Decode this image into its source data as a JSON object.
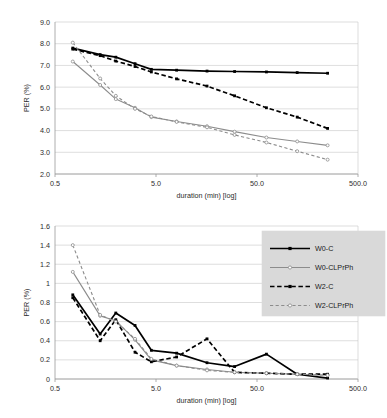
{
  "figure": {
    "title": "",
    "panels": [
      "top-chart",
      "bottom-chart"
    ]
  },
  "colors": {
    "black": "#000000",
    "gray": "#8c8c8c",
    "grid": "#c8c8c8",
    "axis": "#9a9a9a",
    "legend_bg": "#d9d9d9",
    "text": "#2b2b2b"
  },
  "legend": {
    "position": "upper-right-of-bottom-chart",
    "entries": [
      {
        "label": "W0-C",
        "color": "#000000",
        "style": "solid",
        "marker": "square"
      },
      {
        "label": "W0-CLPrPh",
        "color": "#8c8c8c",
        "style": "solid",
        "marker": "circle"
      },
      {
        "label": "W2-C",
        "color": "#000000",
        "style": "dashed",
        "marker": "square"
      },
      {
        "label": "W2-CLPrPh",
        "color": "#8c8c8c",
        "style": "dashed",
        "marker": "circle"
      }
    ]
  },
  "chart_data": [
    {
      "id": "top-chart",
      "type": "line",
      "title": "",
      "xlabel": "duration (min) [log]",
      "ylabel": "PER (%)",
      "xscale": "log",
      "xlim": [
        0.5,
        500.0
      ],
      "ylim": [
        2.0,
        9.0
      ],
      "xticks": [
        0.5,
        5.0,
        50.0,
        500.0
      ],
      "xticklabels": [
        "0.5",
        "5.0",
        "50.0",
        "500.0"
      ],
      "yticks": [
        2.0,
        3.0,
        4.0,
        5.0,
        6.0,
        7.0,
        8.0,
        9.0
      ],
      "yticklabels": [
        "2.0",
        "3.0",
        "4.0",
        "5.0",
        "6.0",
        "7.0",
        "8.0",
        "9.0"
      ],
      "grid": true,
      "legend": false,
      "x": [
        0.75,
        1.4,
        2.0,
        3.1,
        4.5,
        8.0,
        16.0,
        30.0,
        62.0,
        125.0,
        250.0
      ],
      "series": [
        {
          "name": "W0-C",
          "color": "#000000",
          "style": "solid",
          "marker": "square",
          "values": [
            7.8,
            7.5,
            7.38,
            7.08,
            6.82,
            6.78,
            6.74,
            6.72,
            6.7,
            6.67,
            6.64
          ]
        },
        {
          "name": "W0-CLPrPh",
          "color": "#8c8c8c",
          "style": "solid",
          "marker": "circle",
          "values": [
            7.18,
            6.1,
            5.45,
            5.05,
            4.62,
            4.42,
            4.2,
            3.95,
            3.68,
            3.5,
            3.32
          ]
        },
        {
          "name": "W2-C",
          "color": "#000000",
          "style": "dashed",
          "marker": "square",
          "values": [
            7.75,
            7.45,
            7.2,
            6.95,
            6.7,
            6.38,
            6.05,
            5.6,
            5.05,
            4.62,
            4.1
          ]
        },
        {
          "name": "W2-CLPrPh",
          "color": "#8c8c8c",
          "style": "dashed",
          "marker": "circle",
          "values": [
            8.05,
            6.4,
            5.6,
            5.0,
            4.65,
            4.4,
            4.15,
            3.8,
            3.45,
            3.05,
            2.66
          ]
        }
      ]
    },
    {
      "id": "bottom-chart",
      "type": "line",
      "title": "",
      "xlabel": "duration (min) [log]",
      "ylabel": "PER (%)",
      "xscale": "log",
      "xlim": [
        0.5,
        500.0
      ],
      "ylim": [
        0.0,
        1.6
      ],
      "xticks": [
        0.5,
        5.0,
        50.0,
        500.0
      ],
      "xticklabels": [
        "0.5",
        "5.0",
        "50.0",
        "500.0"
      ],
      "yticks": [
        0.0,
        0.2,
        0.4,
        0.6,
        0.8,
        1.0,
        1.2,
        1.4,
        1.6
      ],
      "yticklabels": [
        "0",
        "0.2",
        "0.4",
        "0.6",
        "0.8",
        "1",
        "1.2",
        "1.4",
        "1.6"
      ],
      "grid": true,
      "legend": true,
      "x": [
        0.75,
        1.4,
        2.0,
        3.1,
        4.5,
        8.0,
        16.0,
        30.0,
        62.0,
        125.0,
        250.0
      ],
      "series": [
        {
          "name": "W0-C",
          "color": "#000000",
          "style": "solid",
          "marker": "square",
          "values": [
            0.88,
            0.47,
            0.69,
            0.56,
            0.3,
            0.27,
            0.17,
            0.13,
            0.26,
            0.05,
            0.01
          ]
        },
        {
          "name": "W0-CLPrPh",
          "color": "#8c8c8c",
          "style": "solid",
          "marker": "circle",
          "values": [
            1.12,
            0.66,
            0.61,
            0.41,
            0.2,
            0.14,
            0.1,
            0.07,
            0.06,
            0.05,
            0.04
          ]
        },
        {
          "name": "W2-C",
          "color": "#000000",
          "style": "dashed",
          "marker": "square",
          "values": [
            0.85,
            0.4,
            0.62,
            0.28,
            0.18,
            0.23,
            0.42,
            0.07,
            0.06,
            0.05,
            0.05
          ]
        },
        {
          "name": "W2-CLPrPh",
          "color": "#8c8c8c",
          "style": "dashed",
          "marker": "circle",
          "values": [
            1.4,
            0.67,
            0.6,
            0.42,
            0.21,
            0.14,
            0.09,
            0.07,
            0.06,
            0.05,
            0.04
          ]
        }
      ]
    }
  ]
}
